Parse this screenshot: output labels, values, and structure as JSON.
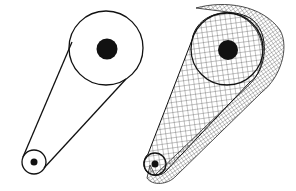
{
  "figure": {
    "colors": {
      "stroke": "#111111",
      "fill_hub": "#111111",
      "background": "#ffffff",
      "mesh": "#333333"
    },
    "left_view": {
      "large_pulley": {
        "cx": 106,
        "cy": 48,
        "r": 37,
        "hub_r": 10.5
      },
      "small_pulley": {
        "cx": 34,
        "cy": 162,
        "r": 12,
        "hub_r": 3.5
      }
    },
    "right_view": {
      "large_pulley": {
        "cx": 227,
        "cy": 49,
        "r": 36,
        "hub_r": 10
      },
      "small_pulley": {
        "cx": 155,
        "cy": 164,
        "r": 11,
        "hub_r": 3.5
      },
      "depth_offset": {
        "dx": 19,
        "dy": 5
      }
    }
  }
}
